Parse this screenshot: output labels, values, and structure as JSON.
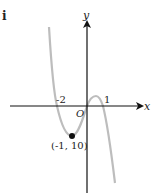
{
  "part_label": "i",
  "axes": {
    "x_label": "x",
    "y_label": "y",
    "origin_label": "O"
  },
  "ticks": {
    "neg_two": "-2",
    "one": "1"
  },
  "point": {
    "label": "(-1, 10)",
    "x": -1,
    "y": 10
  },
  "curve": {
    "color": "#bdbdbd",
    "roots": [
      -2,
      0,
      1
    ],
    "type": "cubic"
  }
}
